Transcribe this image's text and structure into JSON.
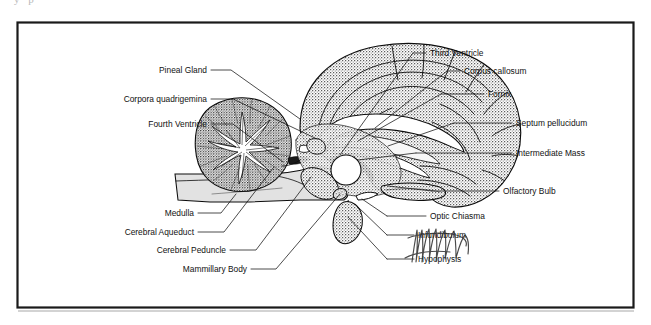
{
  "page": {
    "clipped_top_text": "y p",
    "background_color": "#ffffff",
    "frame_color": "#1a1a1a"
  },
  "figure": {
    "type": "anatomical-diagram",
    "view": "midsagittal",
    "ink_color": "#111111",
    "brainstem_fill": "#e2e2e2"
  },
  "labels_left": [
    {
      "id": "pineal-gland",
      "text": "Pineal Gland",
      "text_x": 207,
      "text_y": 73,
      "leader": "M211,70 L231,70 L300,119"
    },
    {
      "id": "corpora-quadrigemina",
      "text": "Corpora quadrigemina",
      "text_x": 207,
      "text_y": 102,
      "leader": "M211,99 L233,99 L317,139"
    },
    {
      "id": "fourth-ventricle",
      "text": "Fourth Ventricle",
      "text_x": 207,
      "text_y": 127,
      "leader": "M211,124 L233,124 L283,162"
    },
    {
      "id": "medulla",
      "text": "Medulla",
      "text_x": 194,
      "text_y": 216,
      "leader": "M198,213 L221,213 L236,194"
    },
    {
      "id": "cerebral-aqueduct",
      "text": "Cerebral Aqueduct",
      "text_x": 194,
      "text_y": 235,
      "leader": "M198,232 L224,232 L274,167"
    },
    {
      "id": "cerebral-peduncle",
      "text": "Cerebral Peduncle",
      "text_x": 226,
      "text_y": 253,
      "leader": "M230,250 L256,250 L311,177"
    },
    {
      "id": "mammillary-body",
      "text": "Mammillary Body",
      "text_x": 247,
      "text_y": 272,
      "leader": "M251,269 L276,269 L340,194"
    }
  ],
  "labels_right": [
    {
      "id": "third-ventricle",
      "text": "Third Ventricle",
      "text_x": 430,
      "text_y": 56,
      "leader": "M413,53 L426,53 M413,53 L340,155"
    },
    {
      "id": "corpus-callosum",
      "text": "Corpus callosum",
      "text_x": 464,
      "text_y": 74,
      "leader": "M447,71 L460,71 M447,71 L375,128"
    },
    {
      "id": "fornix",
      "text": "Fornix",
      "text_x": 488,
      "text_y": 97,
      "leader": "M441,94 L484,94 M441,94 L358,141"
    },
    {
      "id": "septum-pellucidum",
      "text": "Septum pellucidum",
      "text_x": 516,
      "text_y": 126,
      "leader": "M454,123 L512,123 M454,123 L388,146"
    },
    {
      "id": "intermediate-mass",
      "text": "Intermediate Mass",
      "text_x": 516,
      "text_y": 156,
      "leader": "M416,153 L512,153 M416,153 L358,160"
    },
    {
      "id": "olfactory-bulb",
      "text": "Olfactory Bulb",
      "text_x": 503,
      "text_y": 194,
      "leader": "M432,191 L499,191 M432,191 L388,186"
    },
    {
      "id": "optic-chiasma",
      "text": "Optic Chiasma",
      "text_x": 430,
      "text_y": 219,
      "leader": "M387,216 L426,216 M387,216 L362,199"
    },
    {
      "id": "infundibulum",
      "text": "Infundibulum",
      "text_x": 418,
      "text_y": 238,
      "leader": "M387,235 L414,235 M387,235 L358,207"
    },
    {
      "id": "hypophysis",
      "text": "Hypophysis",
      "text_x": 418,
      "text_y": 262,
      "leader": "M387,259 L414,259 M387,259 L348,217"
    }
  ]
}
